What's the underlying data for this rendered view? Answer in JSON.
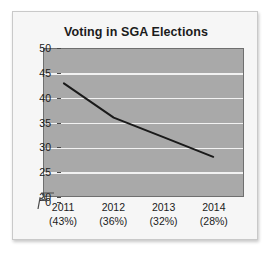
{
  "chart_data": {
    "type": "line",
    "title": "Voting in SGA Elections",
    "xlabel": "",
    "ylabel": "",
    "categories": [
      "2011",
      "2012",
      "2013",
      "2014"
    ],
    "category_sublabels": [
      "(43%)",
      "(36%)",
      "(32%)",
      "(28%)"
    ],
    "values": [
      43,
      36,
      32,
      28
    ],
    "series": [
      {
        "name": "Voting",
        "values": [
          43,
          36,
          32,
          28
        ]
      }
    ],
    "ylim": [
      20,
      50
    ],
    "y_ticks": [
      "0",
      "20",
      "25",
      "30",
      "35",
      "40",
      "45",
      "50"
    ],
    "y_tick_values": [
      0,
      20,
      25,
      30,
      35,
      40,
      45,
      50
    ],
    "axis_break": true,
    "axis_break_between": [
      0,
      20
    ],
    "grid": true,
    "grid_axis": "y",
    "legend": false,
    "legend_position": "none",
    "colors": {
      "plot_background": "#a9a9a9",
      "gridline": "#f2f2f2",
      "line": "#1a1a1a",
      "axis": "#4a4a4a",
      "card_background": "#f6f6f6",
      "text": "#1b1b1b"
    }
  },
  "figure": {
    "title": "Voting in SGA Elections"
  },
  "y_axis": {
    "ticks": [
      {
        "label": "50",
        "value": 50
      },
      {
        "label": "45",
        "value": 45
      },
      {
        "label": "40",
        "value": 40
      },
      {
        "label": "35",
        "value": 35
      },
      {
        "label": "30",
        "value": 30
      },
      {
        "label": "25",
        "value": 25
      },
      {
        "label": "20",
        "value": 20
      },
      {
        "label": "0",
        "value": 0
      }
    ]
  },
  "x_axis": {
    "ticks": [
      {
        "year": "2011",
        "percent": "(43%)"
      },
      {
        "year": "2012",
        "percent": "(36%)"
      },
      {
        "year": "2013",
        "percent": "(32%)"
      },
      {
        "year": "2014",
        "percent": "(28%)"
      }
    ]
  }
}
